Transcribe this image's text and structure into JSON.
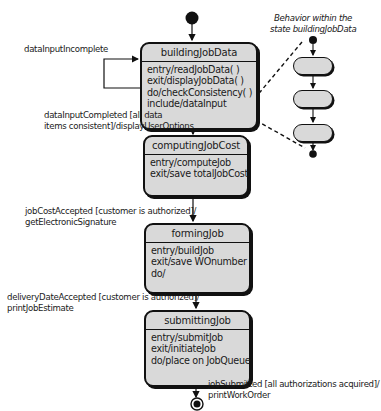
{
  "diagram": {
    "type": "UML state diagram",
    "note": {
      "line1": "Behavior within the",
      "line2": "state buildingJobData"
    },
    "states": [
      {
        "name": "buildingJobData",
        "actions": [
          "entry/readJobData( )",
          "exit/displayJobData( )",
          "do/checkConsistency( )",
          "include/dataInput"
        ]
      },
      {
        "name": "computingJobCost",
        "actions": [
          "entry/computeJob",
          "exit/save totalJobCost"
        ]
      },
      {
        "name": "formingJob",
        "actions": [
          "entry/buildJob",
          "exit/save WOnumber",
          "do/"
        ]
      },
      {
        "name": "submittingJob",
        "actions": [
          "entry/submitJob",
          "exit/initiateJob",
          "do/place on JobQueue"
        ]
      }
    ],
    "transitions": {
      "self_loop": "dataInputIncomplete",
      "t1_line1": "dataInputCompleted [all data",
      "t1_line2": "items consistent]/displayUserOptions",
      "t2_line1": "jobCostAccepted [customer is authorized]/",
      "t2_line2": "getElectronicSignature",
      "t3_line1": "deliveryDateAccepted [customer is authorized]/",
      "t3_line2": "printJobEstimate",
      "t4_line1": "jobSubmitted [all authorizations acquired]/",
      "t4_line2": "printWorkOrder"
    },
    "colors": {
      "state_fill": "#d9d9d9",
      "stroke": "#111111",
      "background": "#ffffff"
    }
  }
}
